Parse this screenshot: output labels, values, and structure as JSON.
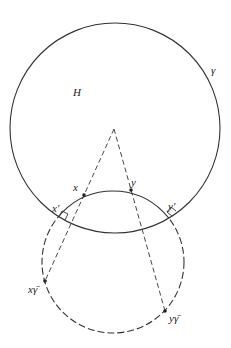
{
  "diagram": {
    "labels": {
      "region": "H",
      "boundary": "γ",
      "x": "x",
      "y": "y",
      "x_prime": "x′",
      "y_prime": "y′",
      "x_gamma_bar": "xγ̄",
      "y_gamma_bar": "yγ̄"
    },
    "big_circle": {
      "cx": 115,
      "cy": 128,
      "r": 105
    },
    "small_circle": {
      "cx": 113,
      "cy": 262,
      "r": 71
    },
    "center_point": {
      "x": 114,
      "y": 129
    },
    "points": {
      "x": {
        "x": 84,
        "y": 195
      },
      "y": {
        "x": 131,
        "y": 190
      },
      "x_prime": {
        "x": 60,
        "y": 217
      },
      "y_prime": {
        "x": 172,
        "y": 216
      },
      "x_gamma_bar": {
        "x": 45,
        "y": 281
      },
      "y_gamma_bar": {
        "x": 165,
        "y": 311
      }
    },
    "colors": {
      "stroke": "#333333",
      "text": "#222222"
    }
  }
}
